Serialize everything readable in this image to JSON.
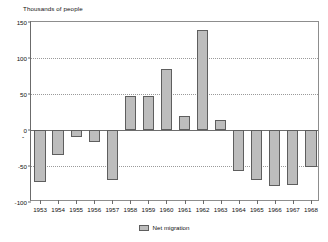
{
  "chart_data": {
    "type": "bar",
    "title": "Thousands of people",
    "xlabel": "",
    "ylabel": "Thousands of people",
    "ylim": [
      -100,
      150
    ],
    "yticks": [
      150,
      100,
      50,
      0,
      -50,
      -100
    ],
    "ytick_labels": [
      "150",
      "100",
      "50",
      "0",
      "-50",
      "-100"
    ],
    "grid": true,
    "legend_position": "bottom-center",
    "categories": [
      "1953",
      "1954",
      "1955",
      "1956",
      "1957",
      "1958",
      "1959",
      "1960",
      "1961",
      "1962",
      "1963",
      "1964",
      "1965",
      "1966",
      "1967",
      "1968"
    ],
    "series": [
      {
        "name": "Net migration",
        "values": [
          -72,
          -35,
          -10,
          -17,
          -70,
          47,
          47,
          85,
          20,
          139,
          14,
          -57,
          -70,
          -78,
          -76,
          -52
        ]
      }
    ],
    "colors": {
      "bar_fill": "#bdbdbd",
      "bar_stroke": "#5e5e5e",
      "gridline": "#9a9a9a",
      "axis": "#6b6b6b",
      "text": "#111111",
      "background": "#ffffff"
    },
    "annotations": {
      "negative_marker": "-"
    }
  },
  "legend": {
    "items": [
      {
        "label": "Net migration"
      }
    ]
  }
}
